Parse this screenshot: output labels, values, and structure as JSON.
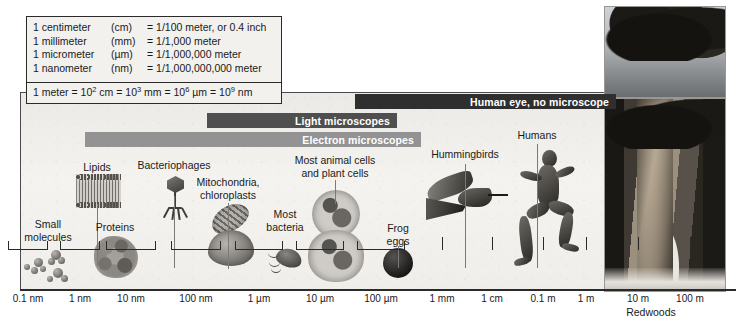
{
  "figure": {
    "key_box": {
      "rows": [
        {
          "unit": "1 centimeter",
          "abbr": "(cm)",
          "value": "= 1/100 meter, or 0.4 inch"
        },
        {
          "unit": "1 millimeter",
          "abbr": "(mm)",
          "value": "= 1/1,000 meter"
        },
        {
          "unit": "1 micrometer",
          "abbr": "(µm)",
          "value": "= 1/1,000,000 meter"
        },
        {
          "unit": "1 nanometer",
          "abbr": "(nm)",
          "value": "= 1/1,000,000,000 meter"
        }
      ],
      "formula_parts": {
        "p1": "1 meter = 10",
        "e1": "2",
        "p2": " cm = 10",
        "e2": "3",
        "p3": " mm = 10",
        "e3": "6",
        "p4": " µm = 10",
        "e4": "9",
        "p5": " nm"
      }
    },
    "range_bars": [
      {
        "label": "Human eye, no microscope",
        "id": "human-eye",
        "color": "#2f2f2f",
        "left": 355,
        "width": 261,
        "top": 94
      },
      {
        "label": "Light microscopes",
        "id": "light-microscopes",
        "color": "#4f4f4f",
        "left": 207,
        "width": 190,
        "top": 113
      },
      {
        "label": "Electron microscopes",
        "id": "electron-microscopes",
        "color": "#939393",
        "left": 85,
        "width": 336,
        "top": 132
      }
    ],
    "axis": {
      "ticks": [
        {
          "label": "0.1 nm",
          "x": 28
        },
        {
          "label": "1 nm",
          "x": 80
        },
        {
          "label": "10 nm",
          "x": 131
        },
        {
          "label": "100 nm",
          "x": 196
        },
        {
          "label": "1 µm",
          "x": 259
        },
        {
          "label": "10 µm",
          "x": 320
        },
        {
          "label": "100 µm",
          "x": 381
        },
        {
          "label": "1 mm",
          "x": 442
        },
        {
          "label": "1 cm",
          "x": 492
        },
        {
          "label": "0.1 m",
          "x": 543
        },
        {
          "label": "1 m",
          "x": 586
        },
        {
          "label": "10 m",
          "x": 638
        },
        {
          "label": "100 m",
          "x": 690
        }
      ]
    },
    "specimens": [
      {
        "id": "small-molecules",
        "label": "Small\nmolecules",
        "lines": [
          "Small",
          "molecules"
        ],
        "x": 48,
        "label_y": 218
      },
      {
        "id": "lipids",
        "label": "Lipids",
        "lines": [
          "Lipids"
        ],
        "x": 97,
        "label_y": 161
      },
      {
        "id": "proteins",
        "label": "Proteins",
        "lines": [
          "Proteins"
        ],
        "x": 115,
        "label_y": 221
      },
      {
        "id": "bacteriophages",
        "label": "Bacteriophages",
        "lines": [
          "Bacteriophages"
        ],
        "x": 174,
        "label_y": 159
      },
      {
        "id": "mitochondria-chloroplasts",
        "label": "Mitochondria,\nchloroplasts",
        "lines": [
          "Mitochondria,",
          "chloroplasts"
        ],
        "x": 228,
        "label_y": 176
      },
      {
        "id": "most-bacteria",
        "label": "Most\nbacteria",
        "lines": [
          "Most",
          "bacteria"
        ],
        "x": 285,
        "label_y": 208
      },
      {
        "id": "most-animal-and-plant-cells",
        "label": "Most animal cells\nand plant cells",
        "lines": [
          "Most animal cells",
          "and plant cells"
        ],
        "x": 335,
        "label_y": 154
      },
      {
        "id": "frog-eggs",
        "label": "Frog\neggs",
        "lines": [
          "Frog",
          "eggs"
        ],
        "x": 398,
        "label_y": 222
      },
      {
        "id": "hummingbirds",
        "label": "Hummingbirds",
        "lines": [
          "Hummingbirds"
        ],
        "x": 465,
        "label_y": 148
      },
      {
        "id": "humans",
        "label": "Humans",
        "lines": [
          "Humans"
        ],
        "x": 537,
        "label_y": 129
      }
    ],
    "photo_caption": "Redwoods"
  }
}
